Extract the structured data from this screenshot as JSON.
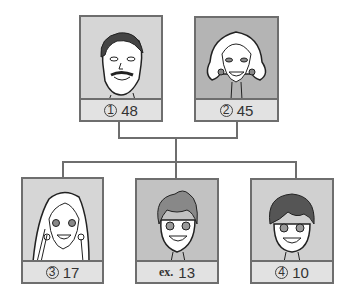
{
  "diagram": {
    "type": "family-tree",
    "parents": [
      {
        "id": "1",
        "marker": "①",
        "value": "48",
        "figure": "man-with-mustache",
        "bg": "#d6d6d6"
      },
      {
        "id": "2",
        "marker": "②",
        "value": "45",
        "figure": "woman-shoulder-hair",
        "bg": "#b4b4b4"
      }
    ],
    "children": [
      {
        "id": "3",
        "marker": "③",
        "value": "17",
        "figure": "girl-long-hair",
        "bg": "#d6d6d6"
      },
      {
        "id": "ex",
        "marker": "ex.",
        "value": "13",
        "figure": "boy",
        "bg": "#c2c2c2"
      },
      {
        "id": "4",
        "marker": "④",
        "value": "10",
        "figure": "younger-boy",
        "bg": "#d0d0d0"
      }
    ]
  },
  "colors": {
    "border": "#6e6e6e",
    "label_bg": "#e2e2e2",
    "line": "#6e6e6e"
  }
}
